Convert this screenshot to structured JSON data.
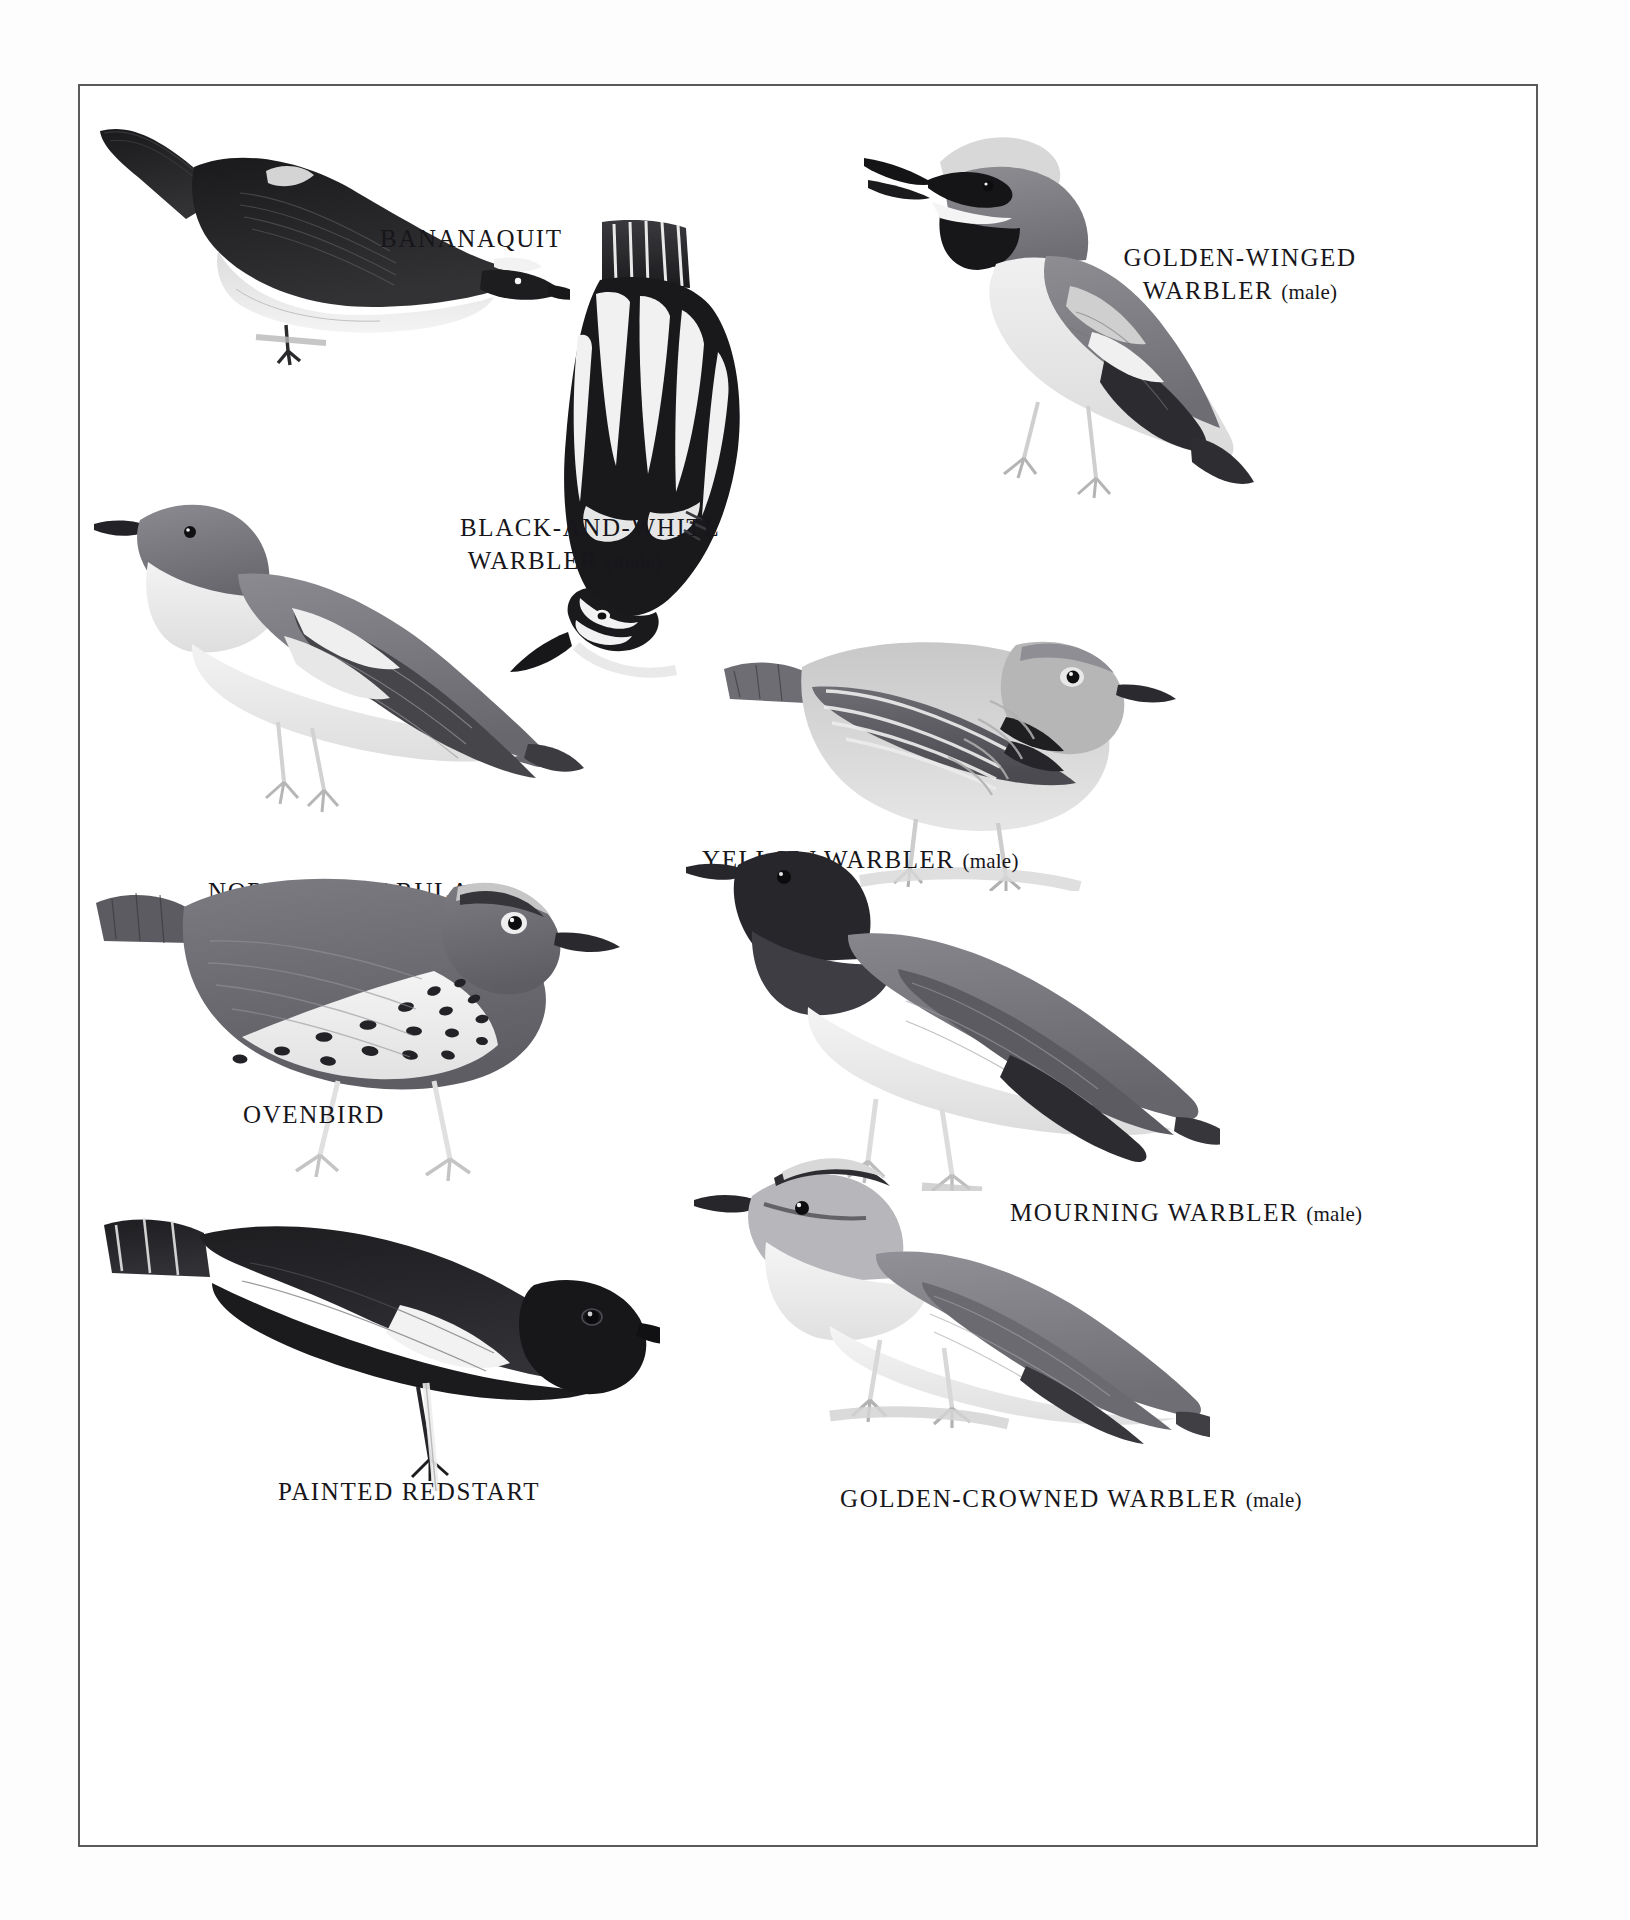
{
  "plate": {
    "kind": "field-guide-illustration-plate",
    "subject": "New World warblers",
    "style": "grayscale engraving",
    "border_color": "#5a5a5a",
    "background_color": "#ffffff",
    "page_background_color": "#fdfdfd",
    "ink_color": "#17161a"
  },
  "labels": {
    "bananaquit": {
      "name": "BANANAQUIT",
      "sex": ""
    },
    "golden_winged_1": {
      "name": "GOLDEN-WINGED",
      "sex": ""
    },
    "golden_winged_2": {
      "name": "WARBLER",
      "sex": "(male)"
    },
    "black_white_1": {
      "name": "BLACK-AND-WHITE",
      "sex": ""
    },
    "black_white_2": {
      "name": "WARBLER",
      "sex": "(male)"
    },
    "northern_parula": {
      "name": "NORTHERN PARULA",
      "sex": ""
    },
    "yellow_warbler": {
      "name": "YELLOW WARBLER",
      "sex": "(male)"
    },
    "ovenbird": {
      "name": "OVENBIRD",
      "sex": ""
    },
    "mourning": {
      "name": "MOURNING WARBLER",
      "sex": "(male)"
    },
    "painted_redstart": {
      "name": "PAINTED REDSTART",
      "sex": ""
    },
    "golden_crowned": {
      "name": "GOLDEN-CROWNED WARBLER",
      "sex": "(male)"
    }
  },
  "figures": [
    {
      "id": "bananaquit",
      "common_name": "Bananaquit",
      "pose": "perched, left-facing, on twig"
    },
    {
      "id": "golden-winged",
      "common_name": "Golden-winged Warbler",
      "pose": "perched, left-facing, bill open"
    },
    {
      "id": "black-and-white",
      "common_name": "Black-and-white Warbler",
      "pose": "dorsal view, head down, climbing"
    },
    {
      "id": "northern-parula",
      "common_name": "Northern Parula",
      "pose": "perched, left-facing"
    },
    {
      "id": "yellow-warbler",
      "common_name": "Yellow Warbler",
      "pose": "perched, right-facing, on branch"
    },
    {
      "id": "ovenbird",
      "common_name": "Ovenbird",
      "pose": "standing on ground, right-facing"
    },
    {
      "id": "mourning-warbler",
      "common_name": "Mourning Warbler",
      "pose": "perched, left-facing"
    },
    {
      "id": "painted-redstart",
      "common_name": "Painted Redstart",
      "pose": "perched, right-facing, on stem"
    },
    {
      "id": "golden-crowned",
      "common_name": "Golden-crowned Warbler",
      "pose": "perched, left-facing, on twig"
    }
  ]
}
